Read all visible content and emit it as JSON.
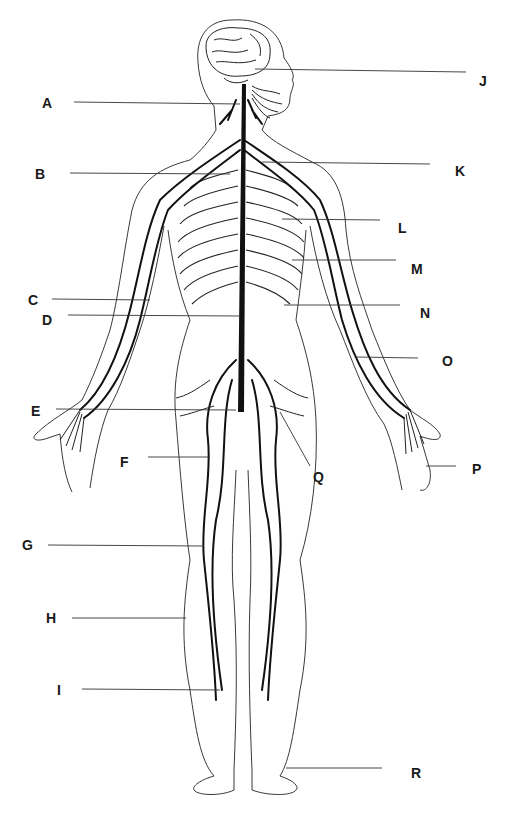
{
  "diagram": {
    "type": "anatomical-line-drawing",
    "labels": [
      {
        "id": "A",
        "text": "A",
        "x": 42,
        "y": 102
      },
      {
        "id": "B",
        "text": "B",
        "x": 35,
        "y": 167
      },
      {
        "id": "C",
        "text": "C",
        "x": 28,
        "y": 293
      },
      {
        "id": "D",
        "text": "D",
        "x": 42,
        "y": 313
      },
      {
        "id": "E",
        "text": "E",
        "x": 31,
        "y": 404
      },
      {
        "id": "F",
        "text": "F",
        "x": 120,
        "y": 455
      },
      {
        "id": "G",
        "text": "G",
        "x": 22,
        "y": 538
      },
      {
        "id": "H",
        "text": "H",
        "x": 46,
        "y": 611
      },
      {
        "id": "I",
        "text": "I",
        "x": 57,
        "y": 683
      },
      {
        "id": "J",
        "text": "J",
        "x": 479,
        "y": 74
      },
      {
        "id": "K",
        "text": "K",
        "x": 455,
        "y": 164
      },
      {
        "id": "L",
        "text": "L",
        "x": 398,
        "y": 221
      },
      {
        "id": "M",
        "text": "M",
        "x": 411,
        "y": 262
      },
      {
        "id": "N",
        "text": "N",
        "x": 420,
        "y": 306
      },
      {
        "id": "O",
        "text": "O",
        "x": 442,
        "y": 354
      },
      {
        "id": "P",
        "text": "P",
        "x": 472,
        "y": 462
      },
      {
        "id": "Q",
        "text": "Q",
        "x": 313,
        "y": 470
      },
      {
        "id": "R",
        "text": "R",
        "x": 411,
        "y": 766
      }
    ]
  }
}
